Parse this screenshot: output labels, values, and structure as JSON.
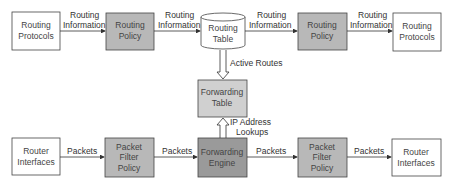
{
  "colors": {
    "box_fill_white": "#ffffff",
    "box_fill_gray": "#b8b8b8",
    "box_fill_dark": "#9a9a9a",
    "box_fill_light_gray": "#d0d0d0",
    "stroke": "#333333"
  },
  "nodes": {
    "routing_protocols_left": [
      "Routing",
      "Protocols"
    ],
    "routing_policy_left": [
      "Routing",
      "Policy"
    ],
    "routing_table": [
      "Routing",
      "Table"
    ],
    "routing_policy_right": [
      "Routing",
      "Policy"
    ],
    "routing_protocols_right": [
      "Routing",
      "Protocols"
    ],
    "forwarding_table": [
      "Forwarding",
      "Table"
    ],
    "router_interfaces_left": [
      "Router",
      "Interfaces"
    ],
    "packet_filter_left": [
      "Packet",
      "Filter",
      "Policy"
    ],
    "forwarding_engine": [
      "Forwarding",
      "Engine"
    ],
    "packet_filter_right": [
      "Packet",
      "Filter",
      "Policy"
    ],
    "router_interfaces_right": [
      "Router",
      "Interfaces"
    ]
  },
  "edges": {
    "ri1": [
      "Routing",
      "Information"
    ],
    "ri2": [
      "Routing",
      "Information"
    ],
    "ri3": [
      "Routing",
      "Information"
    ],
    "ri4": [
      "Routing",
      "Information"
    ],
    "active_routes": "Active Routes",
    "ip_lookups": [
      "IP Address",
      "Lookups"
    ],
    "p1": "Packets",
    "p2": "Packets",
    "p3": "Packets",
    "p4": "Packets"
  }
}
